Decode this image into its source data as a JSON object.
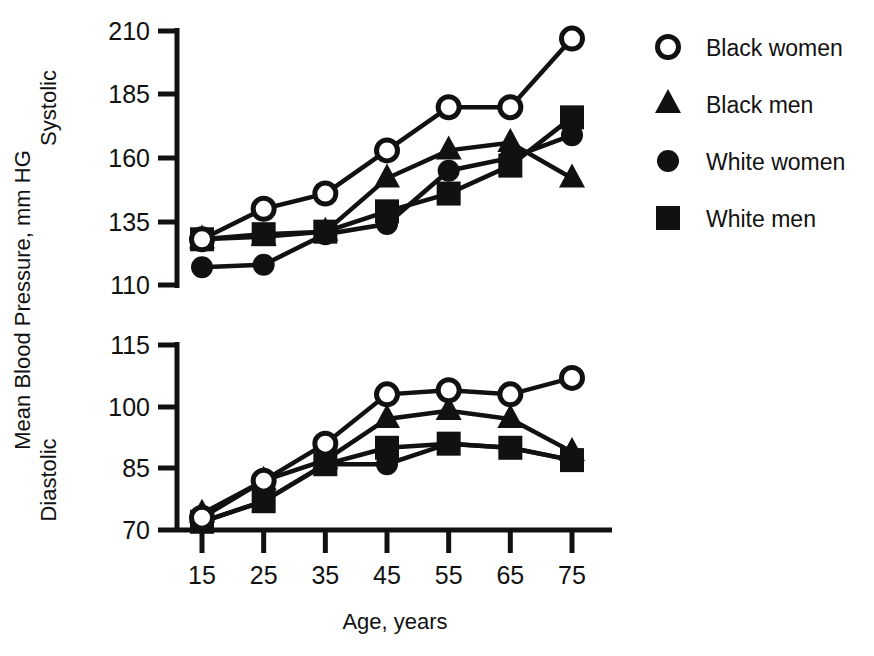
{
  "chart_data": {
    "type": "line",
    "title": "",
    "xlabel": "Age, years",
    "ylabel": "Mean Blood Pressure, mm HG",
    "panels": [
      {
        "name": "Systolic",
        "label": "Systolic",
        "ylim": [
          110,
          210
        ],
        "yticks": [
          110,
          135,
          160,
          185,
          210
        ],
        "categories": [
          15,
          25,
          35,
          45,
          55,
          65,
          75
        ],
        "series": [
          {
            "name": "Black women",
            "marker": "open-circle",
            "values": [
              128,
              140,
              146,
              163,
              180,
              180,
              207
            ]
          },
          {
            "name": "Black men",
            "marker": "filled-triangle",
            "values": [
              128,
              129,
              131,
              152,
              163,
              166,
              152
            ]
          },
          {
            "name": "White women",
            "marker": "filled-circle",
            "values": [
              117,
              118,
              130,
              134,
              155,
              160,
              169
            ]
          },
          {
            "name": "White men",
            "marker": "filled-square",
            "values": [
              128,
              130,
              131,
              139,
              146,
              157,
              176
            ]
          }
        ]
      },
      {
        "name": "Diastolic",
        "label": "Diastolic",
        "ylim": [
          70,
          115
        ],
        "yticks": [
          70,
          85,
          100,
          115
        ],
        "categories": [
          15,
          25,
          35,
          45,
          55,
          65,
          75
        ],
        "series": [
          {
            "name": "Black women",
            "marker": "open-circle",
            "values": [
              73,
              82,
              91,
              103,
              104,
              103,
              107
            ]
          },
          {
            "name": "Black men",
            "marker": "filled-triangle",
            "values": [
              74,
              82,
              87,
              97,
              99,
              97,
              89
            ]
          },
          {
            "name": "White women",
            "marker": "filled-circle",
            "values": [
              72,
              77,
              86,
              86,
              91,
              90,
              87
            ]
          },
          {
            "name": "White men",
            "marker": "filled-square",
            "values": [
              72,
              77,
              86,
              90,
              91,
              90,
              87
            ]
          }
        ]
      }
    ],
    "xticks": [
      15,
      25,
      35,
      45,
      55,
      65,
      75
    ],
    "grid": false,
    "legend_position": "right",
    "legend": [
      {
        "label": "Black women",
        "marker": "open-circle"
      },
      {
        "label": "Black men",
        "marker": "filled-triangle"
      },
      {
        "label": "White women",
        "marker": "filled-circle"
      },
      {
        "label": "White men",
        "marker": "filled-square"
      }
    ]
  },
  "axis": {
    "top": {
      "panel_label": "Systolic",
      "tick_labels": [
        "210",
        "185",
        "160",
        "135",
        "110"
      ]
    },
    "bottom": {
      "panel_label": "Diastolic",
      "tick_labels": [
        "115",
        "100",
        "85",
        "70"
      ]
    },
    "x_tick_labels": [
      "15",
      "25",
      "35",
      "45",
      "55",
      "65",
      "75"
    ],
    "x_axis_title": "Age, years",
    "y_axis_title": "Mean Blood Pressure, mm HG"
  },
  "legend": {
    "items": [
      {
        "label": "Black women",
        "marker": "open-circle-icon"
      },
      {
        "label": "Black men",
        "marker": "filled-triangle-icon"
      },
      {
        "label": "White women",
        "marker": "filled-circle-icon"
      },
      {
        "label": "White men",
        "marker": "filled-square-icon"
      }
    ]
  },
  "colors": {
    "ink": "#111111",
    "background": "#ffffff"
  }
}
